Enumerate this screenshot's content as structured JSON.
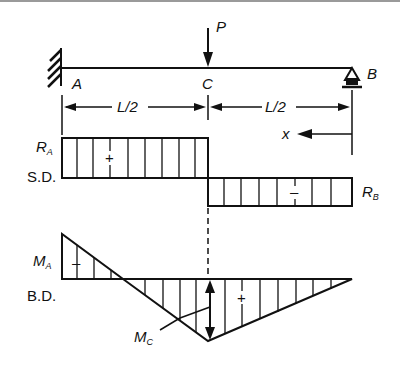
{
  "beam": {
    "load_label": "P",
    "left_support_label": "A",
    "load_point_label": "C",
    "right_support_label": "B",
    "span_left_label": "L/2",
    "span_right_label": "L/2",
    "x_axis_label": "x",
    "left_support_type": "fixed",
    "right_support_type": "roller"
  },
  "shear_diagram": {
    "name": "S.D.",
    "left_value_label": "R",
    "left_value_sub": "A",
    "right_value_label": "R",
    "right_value_sub": "B",
    "left_sign": "+",
    "right_sign": "–"
  },
  "moment_diagram": {
    "name": "B.D.",
    "left_value_label": "M",
    "left_value_sub": "A",
    "mid_value_label": "M",
    "mid_value_sub": "C",
    "left_sign": "–",
    "right_sign": "+"
  },
  "colors": {
    "ink": "#111111",
    "background": "#ffffff"
  }
}
